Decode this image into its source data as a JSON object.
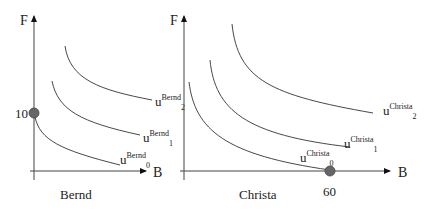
{
  "panels": [
    {
      "name": "Bernd",
      "y_axis_label": "F",
      "x_axis_label": "B",
      "caption": "Bernd",
      "endowment": {
        "axis": "F",
        "value_label": "10"
      },
      "curves": [
        {
          "base": "u",
          "sup": "Bernd",
          "sub": "0"
        },
        {
          "base": "u",
          "sup": "Bernd",
          "sub": "1"
        },
        {
          "base": "u",
          "sup": "Bernd",
          "sub": "2"
        }
      ]
    },
    {
      "name": "Christa",
      "y_axis_label": "F",
      "x_axis_label": "B",
      "caption": "Christa",
      "endowment": {
        "axis": "B",
        "value_label": "60"
      },
      "curves": [
        {
          "base": "u",
          "sup": "Christa",
          "sub": "0"
        },
        {
          "base": "u",
          "sup": "Christa",
          "sub": "1"
        },
        {
          "base": "u",
          "sup": "Christa",
          "sub": "2"
        }
      ]
    }
  ],
  "colors": {
    "line": "#333333",
    "dot": "#666666"
  }
}
